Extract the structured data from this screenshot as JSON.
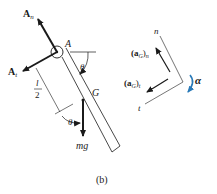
{
  "figure": {
    "caption": "(b)",
    "labels": {
      "An": "A",
      "An_sub": "n",
      "At": "A",
      "At_sub": "t",
      "pin": "A",
      "theta_top": "θ",
      "half_num": "l",
      "half_den": "2",
      "theta_bottom": "θ",
      "G": "G",
      "mg": "mg",
      "axis_n": "n",
      "axis_t": "t",
      "aGn_open": "(a",
      "aGn_sub": "G",
      "aGn_close": ")",
      "aGn_subn": "n",
      "aGt_open": "(a",
      "aGt_sub": "G",
      "aGt_close": ")",
      "aGt_subt": "t",
      "alpha": "α"
    },
    "colors": {
      "ink": "#1a1a1a",
      "alpha_arrow": "#2a7ab8"
    }
  }
}
